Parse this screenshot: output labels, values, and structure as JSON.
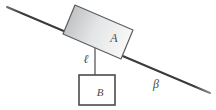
{
  "figure": {
    "kind": "inclined-plane-pulley-diagram",
    "background_color": "#ffffff",
    "labels": {
      "block_a": "A",
      "block_b": "B",
      "length": "ℓ",
      "angle": "β"
    },
    "colors": {
      "incline_line": "#3d3d3d",
      "block_a_stroke": "#55595c",
      "block_a_fill_dark": "#b6b8ba",
      "block_a_fill_light": "#f2f2f2",
      "block_b_stroke": "#4a4a4a",
      "block_b_fill": "#ffffff",
      "rope": "#5a5a5a",
      "baseline": "#c9c9c9",
      "label": "#4a4a4a"
    },
    "geometry": {
      "incline": {
        "x1": 7,
        "y1": 7,
        "x2": 210,
        "y2": 93
      },
      "baseline": {
        "x1": 133,
        "y1": 92,
        "x2": 208,
        "y2": 92
      },
      "rope": {
        "x1": 95,
        "y1": 28,
        "x2": 95,
        "y2": 91
      },
      "block_a_corners": "75,5 133,30 121,59 63,34",
      "block_b_rect": {
        "x": 79,
        "y": 75,
        "width": 36,
        "height": 30
      },
      "label_a_pos": {
        "x": 114,
        "y": 42
      },
      "label_b_pos": {
        "x": 100,
        "y": 95
      },
      "label_ell_pos": {
        "x": 85,
        "y": 62
      },
      "label_beta_pos": {
        "x": 155,
        "y": 87
      }
    }
  }
}
